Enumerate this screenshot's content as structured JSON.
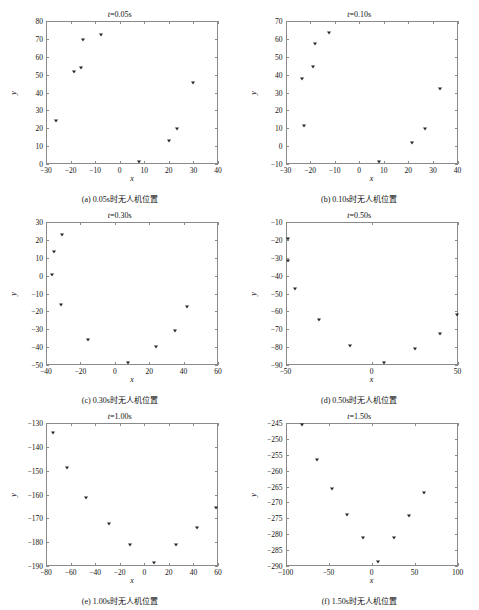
{
  "page": {
    "cut_header_text": "",
    "marker_color": "#262626",
    "axis_color": "#8a8a8a"
  },
  "chart_data": [
    {
      "id": "panel-a",
      "type": "scatter",
      "title": "t=0.05s",
      "title_var": "t",
      "title_rest": "=0.05s",
      "caption": "(a) 0.05s时无人机位置",
      "xlabel": "x",
      "ylabel": "y",
      "xlim": [
        -30,
        40
      ],
      "ylim": [
        0,
        80
      ],
      "xticks": [
        -30,
        -20,
        -10,
        0,
        10,
        20,
        30,
        40
      ],
      "yticks": [
        0,
        10,
        20,
        30,
        40,
        50,
        60,
        70,
        80
      ],
      "grid": false,
      "legend": "none",
      "points": [
        {
          "x": -26.0,
          "y": 24.0
        },
        {
          "x": -18.8,
          "y": 51.3
        },
        {
          "x": -15.6,
          "y": 53.6
        },
        {
          "x": -15.0,
          "y": 69.4
        },
        {
          "x": -7.6,
          "y": 72.2
        },
        {
          "x": 7.7,
          "y": 1.2
        },
        {
          "x": 20.2,
          "y": 13.0
        },
        {
          "x": 23.4,
          "y": 19.5
        },
        {
          "x": 30.0,
          "y": 45.1
        }
      ]
    },
    {
      "id": "panel-b",
      "type": "scatter",
      "title": "t=0.10s",
      "title_var": "t",
      "title_rest": "=0.10s",
      "caption": "(b) 0.10s时无人机位置",
      "xlabel": "x",
      "ylabel": "y",
      "xlim": [
        -30,
        40
      ],
      "ylim": [
        -10,
        70
      ],
      "xticks": [
        -30,
        -20,
        -10,
        0,
        10,
        20,
        30,
        40
      ],
      "yticks": [
        -10,
        0,
        10,
        20,
        30,
        40,
        50,
        60,
        70
      ],
      "grid": false,
      "legend": "none",
      "points": [
        {
          "x": -23.2,
          "y": 37.5
        },
        {
          "x": -22.6,
          "y": 11.0
        },
        {
          "x": -19.0,
          "y": 44.4
        },
        {
          "x": -17.8,
          "y": 57.4
        },
        {
          "x": -12.1,
          "y": 63.2
        },
        {
          "x": 8.2,
          "y": -9.0
        },
        {
          "x": 21.3,
          "y": 1.9
        },
        {
          "x": 26.6,
          "y": 9.7
        },
        {
          "x": 32.8,
          "y": 31.7
        }
      ]
    },
    {
      "id": "panel-c",
      "type": "scatter",
      "title": "t=0.30s",
      "title_var": "t",
      "title_rest": "=0.30s",
      "caption": "(c) 0.30s时无人机位置",
      "xlabel": "x",
      "ylabel": "y",
      "xlim": [
        -40,
        60
      ],
      "ylim": [
        -50,
        30
      ],
      "xticks": [
        -40,
        -20,
        0,
        20,
        40,
        60
      ],
      "yticks": [
        -50,
        -40,
        -30,
        -20,
        -10,
        0,
        10,
        20,
        30
      ],
      "grid": false,
      "legend": "none",
      "points": [
        {
          "x": -35.5,
          "y": 13.2
        },
        {
          "x": -36.5,
          "y": 0.6
        },
        {
          "x": -30.6,
          "y": 22.7
        },
        {
          "x": -31.5,
          "y": -16.4
        },
        {
          "x": -15.3,
          "y": -36.0
        },
        {
          "x": 7.8,
          "y": -48.8
        },
        {
          "x": 23.7,
          "y": -40.0
        },
        {
          "x": 34.8,
          "y": -31.2
        },
        {
          "x": 42.0,
          "y": -17.7
        }
      ]
    },
    {
      "id": "panel-d",
      "type": "scatter",
      "title": "t=0.50s",
      "title_var": "t",
      "title_rest": "=0.50s",
      "caption": "(d) 0.50s时无人机位置",
      "xlabel": "x",
      "ylabel": "y",
      "xlim": [
        -50,
        50
      ],
      "ylim": [
        -90,
        -10
      ],
      "xticks": [
        -50,
        0,
        50
      ],
      "yticks": [
        -90,
        -80,
        -70,
        -60,
        -50,
        -40,
        -30,
        -20,
        -10
      ],
      "grid": false,
      "legend": "none",
      "points": [
        {
          "x": -48.4,
          "y": -19.7
        },
        {
          "x": -48.6,
          "y": -32.0
        },
        {
          "x": -44.4,
          "y": -47.7
        },
        {
          "x": -30.6,
          "y": -64.6
        },
        {
          "x": -12.4,
          "y": -79.4
        },
        {
          "x": 7.0,
          "y": -88.7
        },
        {
          "x": 25.0,
          "y": -80.8
        },
        {
          "x": 39.8,
          "y": -72.6
        },
        {
          "x": 49.6,
          "y": -61.8
        }
      ]
    },
    {
      "id": "panel-e",
      "type": "scatter",
      "title": "t=1.00s",
      "title_var": "t",
      "title_rest": "=1.00s",
      "caption": "(e) 1.00s时无人机位置",
      "xlabel": "x",
      "ylabel": "y",
      "xlim": [
        -80,
        60
      ],
      "ylim": [
        -190,
        -130
      ],
      "xticks": [
        -80,
        -60,
        -40,
        -20,
        0,
        20,
        40,
        60
      ],
      "yticks": [
        -190,
        -180,
        -170,
        -160,
        -150,
        -140,
        -130
      ],
      "grid": false,
      "legend": "none",
      "points": [
        {
          "x": -74.0,
          "y": -134.0
        },
        {
          "x": -63.0,
          "y": -148.8
        },
        {
          "x": -47.5,
          "y": -161.6
        },
        {
          "x": -28.5,
          "y": -172.5
        },
        {
          "x": -11.5,
          "y": -181.2
        },
        {
          "x": 7.5,
          "y": -188.8
        },
        {
          "x": 25.5,
          "y": -181.3
        },
        {
          "x": 43.0,
          "y": -174.2
        },
        {
          "x": 58.5,
          "y": -165.8
        }
      ]
    },
    {
      "id": "panel-f",
      "type": "scatter",
      "title": "t=1.50s",
      "title_var": "t",
      "title_rest": "=1.50s",
      "caption": "(f) 1.50s时无人机位置",
      "xlabel": "x",
      "ylabel": "y",
      "xlim": [
        -100,
        100
      ],
      "ylim": [
        -290,
        -245
      ],
      "xticks": [
        -100,
        -50,
        0,
        50,
        100
      ],
      "yticks": [
        -290,
        -285,
        -280,
        -275,
        -270,
        -265,
        -260,
        -255,
        -250,
        -245
      ],
      "grid": false,
      "legend": "none",
      "points": [
        {
          "x": -81.0,
          "y": -245.6
        },
        {
          "x": -63.0,
          "y": -256.6
        },
        {
          "x": -46.0,
          "y": -265.7
        },
        {
          "x": -28.5,
          "y": -273.9
        },
        {
          "x": -10.0,
          "y": -281.2
        },
        {
          "x": 8.0,
          "y": -288.6
        },
        {
          "x": 26.0,
          "y": -281.3
        },
        {
          "x": 44.0,
          "y": -274.2
        },
        {
          "x": 61.5,
          "y": -266.9
        }
      ]
    }
  ]
}
